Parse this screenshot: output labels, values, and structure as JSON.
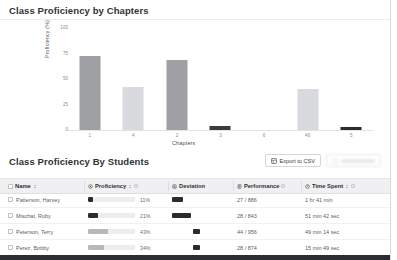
{
  "chart_card": {
    "title": "Class Proficiency by Chapters"
  },
  "chart_data": {
    "type": "bar",
    "title": "Class Proficiency by Chapters",
    "xlabel": "Chapters",
    "ylabel": "Proficiency (%)",
    "categories": [
      "1",
      "4",
      "2",
      "3",
      "6",
      "46",
      "5"
    ],
    "values": [
      73,
      42,
      69,
      4,
      0,
      40,
      3
    ],
    "ylim": [
      0,
      100
    ],
    "yticks": [
      "0",
      "25",
      "50",
      "75",
      "100"
    ],
    "grid": false,
    "legend": "none",
    "bar_colors": [
      "#9fa0a4",
      "#d9dade",
      "#9fa0a4",
      "#3a3b3f",
      "#ffffff",
      "#d9dade",
      "#2b2c30"
    ]
  },
  "table_card": {
    "title": "Class Proficiency By Students",
    "export_button": "Export to CSV",
    "export_icon": "spreadsheet-icon",
    "secondary_button": "",
    "columns": [
      {
        "label": "Name",
        "icon": "checkbox-icon",
        "sort": true,
        "info": false
      },
      {
        "label": "Proficiency",
        "icon": "target-icon",
        "sort": true,
        "info": true
      },
      {
        "label": "Deviation",
        "icon": "chart-icon",
        "sort": false,
        "info": false
      },
      {
        "label": "Performance",
        "icon": "list-icon",
        "sort": false,
        "info": true
      },
      {
        "label": "Time Spent",
        "icon": "clock-icon",
        "sort": true,
        "info": true
      }
    ],
    "rows": [
      {
        "name": "Patterson, Harvey",
        "proficiency_pct": "11%",
        "proficiency_value": 11,
        "deviation_offset": 0,
        "deviation_width": 11,
        "performance": "27 / 886",
        "time_spent": "1 hr 41 min"
      },
      {
        "name": "Mischat, Ruby",
        "proficiency_pct": "21%",
        "proficiency_value": 21,
        "deviation_offset": 0,
        "deviation_width": 19,
        "performance": "28 / 843",
        "time_spent": "51 min 42 sec"
      },
      {
        "name": "Peterson, Terry",
        "proficiency_pct": "43%",
        "proficiency_value": 43,
        "deviation_offset": 21,
        "deviation_width": 7,
        "performance": "44 / 956",
        "time_spent": "49 min 14 sec"
      },
      {
        "name": "Perez, Bobby",
        "proficiency_pct": "34%",
        "proficiency_value": 34,
        "deviation_offset": 21,
        "deviation_width": 7,
        "performance": "28 / 874",
        "time_spent": "15 min 49 sec"
      }
    ]
  },
  "colors": {
    "bar_primary": "#9fa0a4",
    "bar_light": "#d9dade",
    "bar_dark": "#2b2c30",
    "track_fill": "#b7b8bc",
    "card_bg": "#ffffff",
    "page_bg": "#f2f2f4"
  }
}
